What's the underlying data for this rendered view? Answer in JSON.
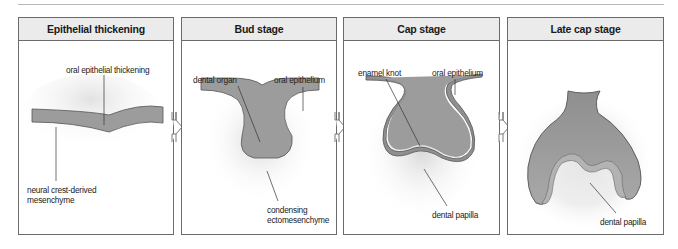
{
  "figure": {
    "colors": {
      "tissue_fill": "#9c9c9c",
      "tissue_stroke": "#555555",
      "mesenchyme_glow": "#e6e6e6",
      "header_bg": "#ebebeb",
      "border": "#6b6b6b"
    },
    "panels": [
      {
        "title": "Epithelial thickening",
        "labels": {
          "a": "oral epithelial thickening",
          "b_line1": "neural crest-derived",
          "b_line2": "mesenchyme"
        }
      },
      {
        "title": "Bud stage",
        "labels": {
          "a": "dental organ",
          "b": "oral epithelium",
          "c_line1": "condensing",
          "c_line2": "ectomesenchyme"
        }
      },
      {
        "title": "Cap stage",
        "labels": {
          "a": "enamel knot",
          "b": "oral epithelium",
          "c": "dental papilla"
        }
      },
      {
        "title": "Late cap stage",
        "labels": {
          "a": "dental papilla"
        }
      }
    ],
    "arrows": [
      "stage-transition-1",
      "stage-transition-2",
      "stage-transition-3"
    ]
  }
}
